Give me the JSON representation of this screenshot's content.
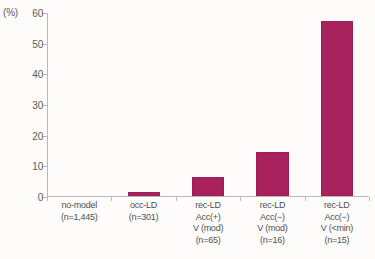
{
  "chart_data": {
    "type": "bar",
    "title": "",
    "subtitle": "",
    "xlabel": "",
    "ylabel": "(%)",
    "unit_label": "(%)",
    "ylim": [
      0,
      60
    ],
    "ytick_values": [
      0,
      10,
      20,
      30,
      40,
      50,
      60
    ],
    "ytick_labels": [
      "0",
      "10",
      "20",
      "30",
      "40",
      "50",
      "60"
    ],
    "grid": false,
    "legend": false,
    "legend_position": "none",
    "bar_color": "#a8235e",
    "axis_color": "#b9b9b9",
    "categories": [
      "no-model\n(n=1,445)",
      "occ-LD\n(n=301)",
      "rec-LD\nAcc(+)\nV (mod)\n(n=65)",
      "rec-LD\nAcc(−)\nV (mod)\n(n=16)",
      "rec-LD\nAcc(−)\nV (<min)\n(n=15)"
    ],
    "category_lines": [
      [
        "no-model",
        "(n=1,445)"
      ],
      [
        "occ-LD",
        "(n=301)"
      ],
      [
        "rec-LD",
        "Acc(+)",
        "V (mod)",
        "(n=65)"
      ],
      [
        "rec-LD",
        "Acc(−)",
        "V (mod)",
        "(n=16)"
      ],
      [
        "rec-LD",
        "Acc(−)",
        "V (<min)",
        "(n=15)"
      ]
    ],
    "values": [
      0,
      1.2,
      6.3,
      14.5,
      57.0
    ],
    "sample_sizes": [
      1445,
      301,
      65,
      16,
      15
    ]
  }
}
